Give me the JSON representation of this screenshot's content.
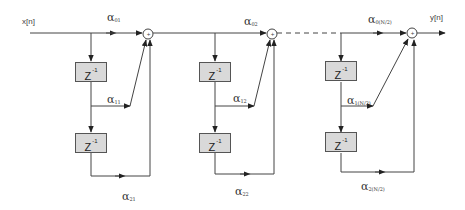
{
  "diagram": {
    "type": "FIR filter block diagram (folded / cascaded second-order sections)",
    "input_label": "x[n]",
    "output_label": "y[n]",
    "delay_label": "Z",
    "delay_exponent": "-1",
    "adder_symbol": "+",
    "colors": {
      "line": "#333333",
      "delay_fill": "#d9d9d9",
      "delay_border": "#555555",
      "background": "#ffffff"
    },
    "stages": [
      {
        "coefficients": [
          {
            "symbol": "α",
            "sub": "01"
          },
          {
            "symbol": "α",
            "sub": "11"
          },
          {
            "symbol": "α",
            "sub": "21"
          }
        ]
      },
      {
        "coefficients": [
          {
            "symbol": "α",
            "sub": "02"
          },
          {
            "symbol": "α",
            "sub": "12"
          },
          {
            "symbol": "α",
            "sub": "22"
          }
        ]
      },
      {
        "coefficients": [
          {
            "symbol": "α",
            "sub": "0(N/2)"
          },
          {
            "symbol": "α",
            "sub": "1(N/2)"
          },
          {
            "symbol": "α",
            "sub": "2(N/2)"
          }
        ]
      }
    ],
    "connector_between_stage2_and_stage3": "dashed"
  }
}
